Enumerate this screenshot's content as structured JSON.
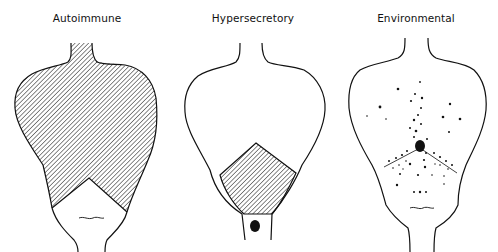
{
  "panels": [
    {
      "id": "autoimmune",
      "label": "Autoimmune",
      "shading": "upper-lobes-hatched"
    },
    {
      "id": "hypersecretory",
      "label": "Hypersecretory",
      "shading": "lower-pentagon-hatched",
      "marker": "solid-dot-below-pentagon"
    },
    {
      "id": "environmental",
      "label": "Environmental",
      "shading": "stippled-dots-converging-center"
    }
  ],
  "colors": {
    "line": "#111111",
    "background": "#ffffff"
  }
}
